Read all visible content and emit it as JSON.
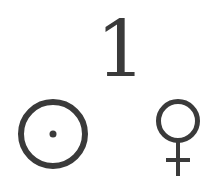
{
  "numeral": {
    "text": "1"
  },
  "symbols": [
    {
      "name": "sun",
      "glyph": "☉"
    },
    {
      "name": "venus",
      "glyph": "♀"
    }
  ],
  "colors": {
    "ink": "#3a3a3a",
    "background": "#ffffff"
  }
}
